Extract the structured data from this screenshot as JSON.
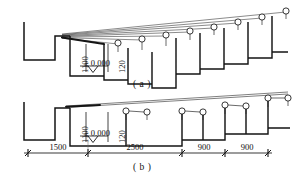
{
  "drawing": {
    "title": "Stair section setting-out diagrams",
    "background": "#ffffff",
    "ink": "#151515",
    "thin_ink": "#3a3a3a"
  },
  "figures": [
    {
      "id": "a",
      "caption": "( a )",
      "caption_x": 133,
      "caption_y": 79,
      "step_count": 8,
      "marker_shape": "circle-balloon",
      "sight_lines": "fan-from-single-point",
      "paired_markers": false,
      "labels": {
        "riser_height": "1100",
        "slab_thickness": "120",
        "datum": "± 0.000"
      }
    },
    {
      "id": "b",
      "caption": "( b )",
      "caption_x": 133,
      "caption_y": 162,
      "step_count": 4,
      "marker_shape": "circle-balloon",
      "sight_lines": "single-upper-chord",
      "paired_markers": true,
      "labels": {
        "riser_height": "1100",
        "slab_thickness": "120",
        "datum": "± 0.000"
      }
    }
  ],
  "dimension_chain": {
    "tick_style": "architectural-slash",
    "y": 153,
    "segments": [
      {
        "label": "1500",
        "x1": 28,
        "x2": 88
      },
      {
        "label": "2500",
        "x1": 88,
        "x2": 182
      },
      {
        "label": "900",
        "x1": 182,
        "x2": 225
      },
      {
        "label": "900",
        "x1": 225,
        "x2": 268
      }
    ]
  },
  "annotations": {
    "level_symbol": "inverted-triangle",
    "datum_text": "± 0.000",
    "vertical_text_1": "1100",
    "vertical_text_2": "120"
  }
}
